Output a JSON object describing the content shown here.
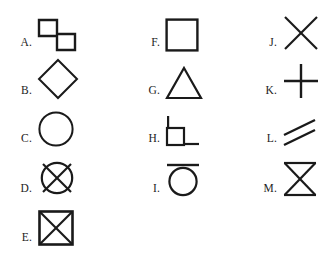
{
  "page": {
    "background_color": "#ffffff",
    "stroke_color": "#1a1a1a",
    "label_color": "#1c1c1c"
  },
  "columns": [
    {
      "name": "column-1",
      "items": [
        {
          "label": "A.",
          "shape": "two-offset-squares",
          "shape_name": "stepped double square"
        },
        {
          "label": "B.",
          "shape": "diamond",
          "shape_name": "diamond"
        },
        {
          "label": "C.",
          "shape": "circle",
          "shape_name": "circle"
        },
        {
          "label": "D.",
          "shape": "circle-with-x",
          "shape_name": "crossed circle"
        },
        {
          "label": "E.",
          "shape": "square-with-x",
          "shape_name": "crossed square"
        }
      ]
    },
    {
      "name": "column-2",
      "items": [
        {
          "label": "F.",
          "shape": "square",
          "shape_name": "square"
        },
        {
          "label": "G.",
          "shape": "triangle",
          "shape_name": "triangle"
        },
        {
          "label": "H.",
          "shape": "right-angle-square",
          "shape_name": "square with extended legs"
        },
        {
          "label": "I.",
          "shape": "circle-with-top-bar",
          "shape_name": "circle under a bar"
        }
      ]
    },
    {
      "name": "column-3",
      "items": [
        {
          "label": "J.",
          "shape": "x-cross",
          "shape_name": "diagonal cross"
        },
        {
          "label": "K.",
          "shape": "plus-cross",
          "shape_name": "plus cross"
        },
        {
          "label": "L.",
          "shape": "parallel-diagonal-lines",
          "shape_name": "two parallel diagonal lines"
        },
        {
          "label": "M.",
          "shape": "hourglass",
          "shape_name": "hourglass"
        }
      ]
    }
  ]
}
